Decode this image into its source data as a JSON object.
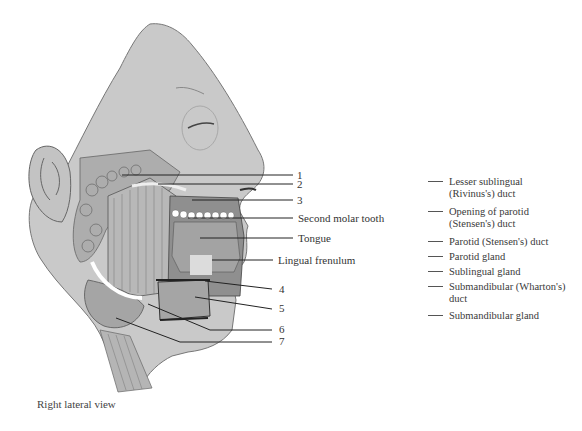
{
  "figure": {
    "view_caption": "Right lateral view",
    "colors": {
      "skin": "#c9c9c9",
      "skin_outline": "#777777",
      "gland": "#a9a9a9",
      "muscle": "#b5b5b5",
      "tongue": "#9e9e9e",
      "teeth": "#ffffff",
      "dark": "#3c3c3c",
      "leader_line": "#222222"
    },
    "numbered_labels": [
      {
        "n": "1",
        "y": 176
      },
      {
        "n": "2",
        "y": 184
      },
      {
        "n": "3",
        "y": 200
      },
      {
        "n": "4",
        "y": 290
      },
      {
        "n": "5",
        "y": 309
      },
      {
        "n": "6",
        "y": 330
      },
      {
        "n": "7",
        "y": 341
      }
    ],
    "text_labels": [
      {
        "text": "Second molar tooth",
        "y": 219
      },
      {
        "text": "Tongue",
        "y": 239
      },
      {
        "text": "Lingual frenulum",
        "y": 260
      }
    ]
  },
  "answer_key": {
    "items": [
      {
        "line1": "Lesser sublingual",
        "line2": "(Rivinus's) duct"
      },
      {
        "line1": "Opening of parotid",
        "line2": "(Stensen's) duct"
      },
      {
        "line1": "Parotid (Stensen's) duct",
        "line2": ""
      },
      {
        "line1": "Parotid gland",
        "line2": ""
      },
      {
        "line1": "Sublingual gland",
        "line2": ""
      },
      {
        "line1": "Submandibular (Wharton's)",
        "line2": "duct"
      },
      {
        "line1": "Submandibular gland",
        "line2": ""
      }
    ]
  }
}
